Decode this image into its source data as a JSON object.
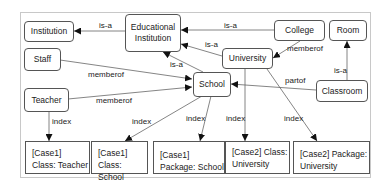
{
  "diagram": {
    "type": "ontology-graph",
    "nodes": {
      "institution": {
        "label": "Institution"
      },
      "educational_institution": {
        "label_line1": "Educational",
        "label_line2": "Institution"
      },
      "college": {
        "label": "College"
      },
      "room": {
        "label": "Room"
      },
      "staff": {
        "label": "Staff"
      },
      "university": {
        "label": "University"
      },
      "school": {
        "label": "School"
      },
      "classroom": {
        "label": "Classroom"
      },
      "teacher": {
        "label": "Teacher"
      }
    },
    "index_boxes": [
      {
        "line1": "[Case1]",
        "line2": "Class: Teacher"
      },
      {
        "line1": "[Case1]",
        "line2": "Class: School"
      },
      {
        "line1": "[Case1]",
        "line2": "Package: School"
      },
      {
        "line1": "[Case2] Class:",
        "line2": "University"
      },
      {
        "line1": "[Case2] Package:",
        "line2": "University"
      }
    ],
    "edges": [
      {
        "from": "Educational Institution",
        "to": "Institution",
        "label": "is-a"
      },
      {
        "from": "College",
        "to": "Educational Institution",
        "label": "is-a"
      },
      {
        "from": "University",
        "to": "Educational Institution",
        "label": "is-a"
      },
      {
        "from": "School",
        "to": "Educational Institution",
        "label": "is-a"
      },
      {
        "from": "College",
        "to": "University",
        "label": "memberof"
      },
      {
        "from": "Staff",
        "to": "School",
        "label": "memberof"
      },
      {
        "from": "Teacher",
        "to": "School",
        "label": "memberof"
      },
      {
        "from": "Classroom",
        "to": "School",
        "label": "partof"
      },
      {
        "from": "Classroom",
        "to": "Room",
        "label": "is-a"
      },
      {
        "from": "Teacher",
        "to": "[Case1] Class: Teacher",
        "label": "index"
      },
      {
        "from": "School",
        "to": "[Case1] Class: School",
        "label": "index"
      },
      {
        "from": "School",
        "to": "[Case1] Package: School",
        "label": "index"
      },
      {
        "from": "University",
        "to": "[Case2] Class: University",
        "label": "index"
      },
      {
        "from": "University",
        "to": "[Case2] Package: University",
        "label": "index"
      }
    ],
    "edge_labels": {
      "isa_edu_inst": "is-a",
      "isa_college_edu": "is-a",
      "isa_univ_edu": "is-a",
      "isa_school_edu": "is-a",
      "memberof_college_univ": "memberof",
      "memberof_staff_school": "memberof",
      "memberof_teacher_school": "memberof",
      "partof_classroom_school": "partof",
      "isa_classroom_room": "is-a",
      "index_teacher": "index",
      "index_school_class": "index",
      "index_school_pkg": "index",
      "index_univ_class": "index",
      "index_univ_pkg": "index"
    }
  }
}
